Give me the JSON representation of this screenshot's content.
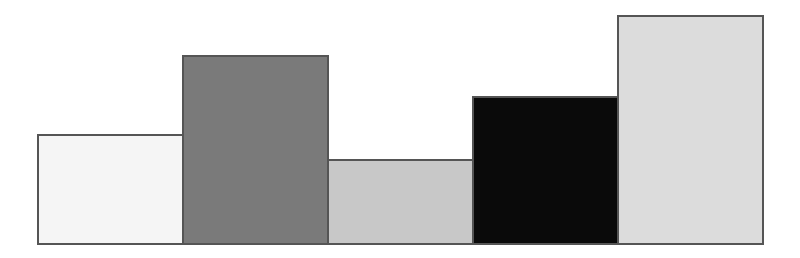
{
  "chart_data": {
    "type": "bar",
    "title": "",
    "xlabel": "",
    "ylabel": "",
    "categories": [
      "1",
      "2",
      "3",
      "4",
      "5"
    ],
    "values": [
      109,
      188,
      84,
      147,
      228
    ],
    "ylim": [
      0,
      243
    ],
    "grid": false,
    "legend": null,
    "colors": [
      "#f5f5f5",
      "#7a7a7a",
      "#c8c8c8",
      "#0a0a0a",
      "#dcdcdc"
    ],
    "border_color": "#555555"
  },
  "layout": {
    "baseline_y": 243,
    "first_bar_x": 37,
    "bar_width": 145
  }
}
